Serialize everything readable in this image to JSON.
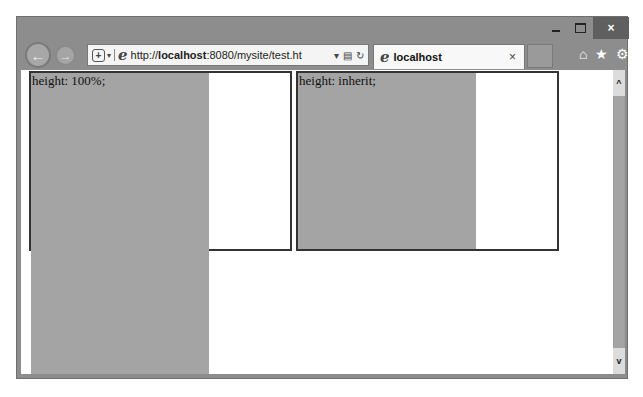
{
  "window": {
    "controls": {
      "minimize": "–",
      "maximize": "□",
      "close": "×"
    }
  },
  "toolbar": {
    "back_icon": "←",
    "forward_icon": "→",
    "address": {
      "shield_icon": "+",
      "dropdown_icon": "▾",
      "url_prefix": "http://",
      "url_host": "localhost",
      "url_rest": ":8080/mysite/test.ht",
      "search_dropdown_icon": "▾",
      "compat_icon": "▤",
      "refresh_icon": "↻"
    },
    "tab": {
      "label": "localhost",
      "close_icon": "×"
    },
    "icons": {
      "home": "⌂",
      "favorites": "★",
      "settings": "⚙"
    }
  },
  "page": {
    "box1": {
      "label": "height: 100%;"
    },
    "box2": {
      "label": "height: inherit;"
    }
  },
  "scrollbar": {
    "up_icon": "^",
    "down_icon": "v"
  },
  "colors": {
    "chrome": "#8d8d8d",
    "fill": "#a4a4a4",
    "border": "#333333",
    "page_bg": "#ffffff"
  }
}
